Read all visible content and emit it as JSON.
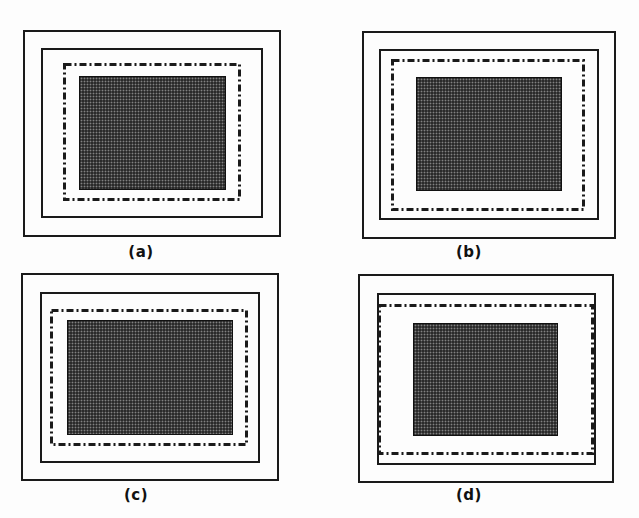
{
  "figure": {
    "panels": [
      {
        "label": "(a)",
        "outer": {
          "x": 23,
          "y": 30,
          "w": 258,
          "h": 207
        },
        "inner": {
          "x": 41,
          "y": 48,
          "w": 222,
          "h": 170
        },
        "dashdot": {
          "x": 63,
          "y": 63,
          "w": 178,
          "h": 138
        },
        "dark": {
          "x": 79,
          "y": 76,
          "w": 147,
          "h": 114
        },
        "label_pos": {
          "x": 141,
          "y": 243
        }
      },
      {
        "label": "(b)",
        "outer": {
          "x": 362,
          "y": 31,
          "w": 254,
          "h": 208
        },
        "inner": {
          "x": 379,
          "y": 49,
          "w": 220,
          "h": 171
        },
        "dashdot": {
          "x": 391,
          "y": 59,
          "w": 194,
          "h": 152
        },
        "dark": {
          "x": 416,
          "y": 77,
          "w": 146,
          "h": 114
        },
        "label_pos": {
          "x": 469,
          "y": 243
        }
      },
      {
        "label": "(c)",
        "outer": {
          "x": 21,
          "y": 273,
          "w": 258,
          "h": 208
        },
        "inner": {
          "x": 40,
          "y": 292,
          "w": 220,
          "h": 171
        },
        "dashdot": {
          "x": 50,
          "y": 309,
          "w": 198,
          "h": 137
        },
        "dark": {
          "x": 67,
          "y": 320,
          "w": 166,
          "h": 115
        },
        "label_pos": {
          "x": 136,
          "y": 486
        }
      },
      {
        "label": "(d)",
        "outer": {
          "x": 358,
          "y": 274,
          "w": 256,
          "h": 209
        },
        "inner": {
          "x": 377,
          "y": 293,
          "w": 219,
          "h": 172
        },
        "dashdot": {
          "x": 378,
          "y": 304,
          "w": 216,
          "h": 151
        },
        "dark": {
          "x": 413,
          "y": 323,
          "w": 145,
          "h": 113
        },
        "label_pos": {
          "x": 469,
          "y": 486
        }
      }
    ],
    "colors": {
      "line": "#1a1a1a",
      "fill": "#2a2a2a",
      "background": "#fdfdfd"
    },
    "legend": {
      "outer_box": "solid rectangle (outer boundary)",
      "inner_box": "solid rectangle (inner boundary)",
      "dash_dot_box": "dash-dot rectangle",
      "shaded_box": "halftone-shaded rectangle"
    }
  }
}
